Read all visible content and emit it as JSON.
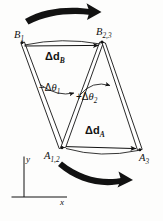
{
  "figure": {
    "background_color": "#fdfdfc",
    "ink_color": "#121212",
    "vertices": [
      {
        "id": "B1",
        "base": "B",
        "subscript": "1",
        "x": 22,
        "y": 42,
        "label_x": 14,
        "label_y": 30
      },
      {
        "id": "B23",
        "base": "B",
        "subscript": "2,3",
        "x": 102,
        "y": 41,
        "label_x": 96,
        "label_y": 27
      },
      {
        "id": "A12",
        "base": "A",
        "subscript": "1,2",
        "x": 61,
        "y": 148,
        "label_x": 44,
        "label_y": 151
      },
      {
        "id": "A3",
        "base": "A",
        "subscript": "3",
        "x": 140,
        "y": 150,
        "label_x": 139,
        "label_y": 153
      }
    ],
    "displacement_labels": [
      {
        "id": "delta-d-B",
        "delta": "Δ",
        "vector": "d",
        "subscript": "B",
        "from": "B1",
        "to": "B23"
      },
      {
        "id": "delta-d-A",
        "delta": "Δ",
        "vector": "d",
        "subscript": "A",
        "from": "A12",
        "to": "A3"
      }
    ],
    "angle_labels": [
      {
        "id": "minus-delta-theta-1",
        "sign": "−",
        "delta": "Δ",
        "symbol": "θ",
        "subscript": "1",
        "sense": "negative"
      },
      {
        "id": "plus-delta-theta-2",
        "sign": "+",
        "delta": "Δ",
        "symbol": "θ",
        "subscript": "2",
        "sense": "positive"
      }
    ],
    "axes": {
      "x_label": "x",
      "y_label": "y",
      "origin_x": 24,
      "origin_y": 197
    },
    "motion_arrows": [
      {
        "id": "top-motion-arrow",
        "direction": "right",
        "curvature": "concave-down",
        "position": "above-B-link"
      },
      {
        "id": "bottom-motion-arrow",
        "direction": "right",
        "curvature": "concave-up",
        "position": "below-A-link"
      }
    ]
  }
}
